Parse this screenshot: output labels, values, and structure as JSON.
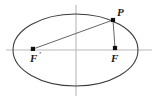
{
  "figure": {
    "background_color": "#ffffff",
    "width": 160,
    "height": 101,
    "ellipse": {
      "center_x": 75.5,
      "center_y": 50,
      "radius_x": 62.5,
      "radius_y": 36,
      "stroke_color": "#3a3a3a"
    },
    "axes": {
      "color": "#b9b9b9",
      "horizontal": {
        "x1": 6,
        "y1": 50,
        "x2": 152,
        "y2": 50
      },
      "vertical": {
        "x1": 76,
        "y1": 5,
        "x2": 76,
        "y2": 96
      }
    },
    "points": [
      {
        "name": "left-focus",
        "label": "F",
        "prime": "′",
        "x": 33,
        "y": 49,
        "label_x": 30,
        "label_y": 62,
        "prime_x": 39,
        "prime_y": 58
      },
      {
        "name": "right-focus",
        "label": "F",
        "prime": "",
        "x": 115,
        "y": 48,
        "label_x": 111,
        "label_y": 62,
        "prime_x": 0,
        "prime_y": 0
      },
      {
        "name": "point-p",
        "label": "P",
        "prime": "",
        "x": 113,
        "y": 20,
        "label_x": 117,
        "label_y": 16,
        "prime_x": 0,
        "prime_y": 0
      }
    ],
    "segments": [
      {
        "name": "segment-left-focus-to-p",
        "x1": 33,
        "y1": 49,
        "x2": 113,
        "y2": 20
      },
      {
        "name": "segment-p-to-right-focus",
        "x1": 113,
        "y1": 20,
        "x2": 115,
        "y2": 48
      }
    ]
  }
}
